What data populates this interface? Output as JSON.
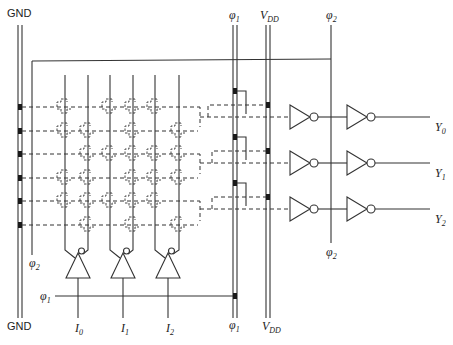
{
  "diagram": {
    "type": "PLA circuit (dynamic AND-OR array with clocked input/output buffers)",
    "colors": {
      "line": "#333333",
      "contact": "#1a1a1a",
      "background": "#ffffff"
    },
    "rails": {
      "gnd": {
        "label_top": "GND",
        "label_bottom": "GND"
      },
      "phi1": {
        "symbol": "φ",
        "sub": "1"
      },
      "vdd": {
        "symbol": "V",
        "sub": "DD"
      },
      "phi2_right": {
        "symbol": "φ",
        "sub": "2"
      },
      "phi2_left": {
        "symbol": "φ",
        "sub": "2"
      },
      "phi1_input": {
        "symbol": "φ",
        "sub": "1"
      }
    },
    "inputs": [
      {
        "symbol": "I",
        "sub": "0"
      },
      {
        "symbol": "I",
        "sub": "1"
      },
      {
        "symbol": "I",
        "sub": "2"
      }
    ],
    "outputs": [
      {
        "symbol": "Y",
        "sub": "0"
      },
      {
        "symbol": "Y",
        "sub": "1"
      },
      {
        "symbol": "Y",
        "sub": "2"
      }
    ],
    "and_plane": {
      "columns": [
        "I0",
        "I0'",
        "I1",
        "I1'",
        "I2",
        "I2'"
      ],
      "rows": 6,
      "transistors": [
        [
          0,
          2,
          3,
          4
        ],
        [
          0,
          1,
          3,
          5
        ],
        [
          1,
          2,
          3,
          4,
          5
        ],
        [
          0,
          1,
          3,
          4,
          5
        ],
        [
          0,
          1,
          2,
          3,
          4
        ],
        [
          1,
          3,
          5
        ]
      ]
    }
  }
}
